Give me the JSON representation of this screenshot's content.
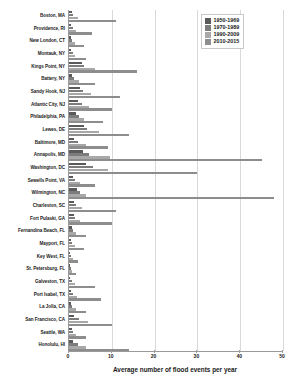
{
  "chart_data": {
    "type": "bar",
    "orientation": "horizontal",
    "title": "",
    "xlabel": "Average number of flood events per year",
    "ylabel": "",
    "xlim": [
      0,
      50
    ],
    "xticks": [
      0,
      10,
      20,
      30,
      40,
      50
    ],
    "grid": true,
    "legend_position": "top-right",
    "categories": [
      "Boston, MA",
      "Providence, RI",
      "New London, CT",
      "Montauk, NY",
      "Kings Point, NY",
      "Battery, NY",
      "Sandy Hook, NJ",
      "Atlantic City, NJ",
      "Philadelphia, PA",
      "Lewes, DE",
      "Baltimore, MD",
      "Annapolis, MD",
      "Washington, DC",
      "Sewells Point, VA",
      "Wilmington, NC",
      "Charleston, SC",
      "Fort Pulaski, GA",
      "Fernandina Beach, FL",
      "Mayport, FL",
      "Key West, FL",
      "St. Petersburg, FL",
      "Galveston, TX",
      "Port Isabel, TX",
      "La Jolla, CA",
      "San Francisco, CA",
      "Seattle, WA",
      "Honolulu, HI"
    ],
    "series": [
      {
        "name": "1950-1969",
        "color": "#5a5a5a",
        "values": [
          0.6,
          0.5,
          0.4,
          0.5,
          3.0,
          0.6,
          2.5,
          2.2,
          1.6,
          3.4,
          1.2,
          3.2,
          4.0,
          1.0,
          1.8,
          1.2,
          1.1,
          0.6,
          0.4,
          0.3,
          0.2,
          0.3,
          0.5,
          0.4,
          1.2,
          0.6,
          1.0
        ]
      },
      {
        "name": "1970-1989",
        "color": "#7c7c7c",
        "values": [
          1.0,
          0.9,
          0.8,
          0.9,
          3.6,
          1.2,
          3.2,
          3.0,
          2.3,
          4.2,
          2.0,
          4.6,
          5.6,
          1.4,
          2.5,
          1.6,
          1.5,
          0.9,
          0.7,
          0.5,
          0.4,
          0.6,
          0.9,
          0.8,
          2.4,
          1.0,
          2.2
        ]
      },
      {
        "name": "1990-2009",
        "color": "#a8a8a8",
        "values": [
          2.0,
          1.6,
          1.3,
          1.4,
          6.0,
          2.4,
          5.2,
          4.6,
          3.6,
          7.0,
          4.0,
          9.6,
          9.0,
          2.6,
          4.0,
          3.0,
          2.6,
          1.6,
          1.4,
          1.0,
          0.8,
          1.4,
          1.8,
          1.6,
          4.4,
          1.6,
          4.0
        ]
      },
      {
        "name": "2010-2015",
        "color": "#8d8d8d",
        "values": [
          11.0,
          5.4,
          3.4,
          4.0,
          16.0,
          6.0,
          12.0,
          10.0,
          8.0,
          14.0,
          9.0,
          45.0,
          30.0,
          6.0,
          48.0,
          11.0,
          10.0,
          4.0,
          3.4,
          2.0,
          1.6,
          6.0,
          7.4,
          4.0,
          10.0,
          4.0,
          14.0
        ]
      }
    ]
  },
  "legend": {
    "items": [
      {
        "label": "1950-1969",
        "color": "#5a5a5a"
      },
      {
        "label": "1970-1989",
        "color": "#7c7c7c"
      },
      {
        "label": "1990-2009",
        "color": "#a8a8a8"
      },
      {
        "label": "2010-2015",
        "color": "#8d8d8d"
      }
    ]
  }
}
